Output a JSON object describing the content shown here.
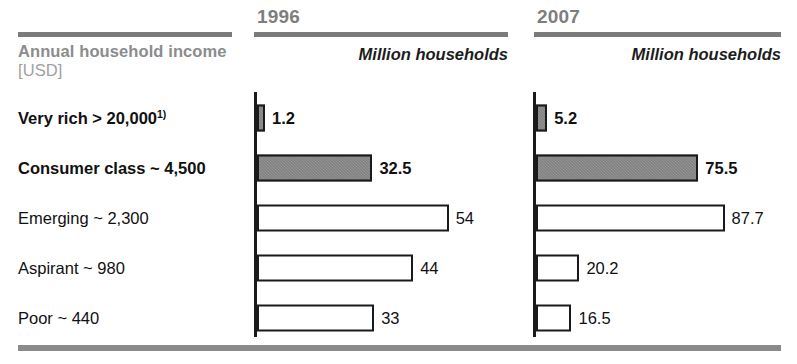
{
  "header": {
    "income_title": "Annual household income",
    "income_unit": "[USD]",
    "year_1996": "1996",
    "year_2007": "2007",
    "unit_1996": "Million households",
    "unit_2007": "Million households"
  },
  "chart_data": {
    "type": "bar",
    "orientation": "horizontal",
    "title": "Annual household income [USD]",
    "xlabel": "Million households",
    "ylabel": "Annual household income [USD]",
    "grid": false,
    "legend": "none",
    "categories": [
      "Very rich > 20,000",
      "Consumer class ~ 4,500",
      "Emerging ~ 2,300",
      "Aspirant ~ 980",
      "Poor ~ 440"
    ],
    "category_notes": [
      "1)",
      "",
      "",
      "",
      ""
    ],
    "category_emphasis": [
      true,
      true,
      false,
      false,
      false
    ],
    "series": [
      {
        "name": "1996",
        "unit": "Million households",
        "values": [
          1.2,
          32.5,
          54,
          44,
          33
        ],
        "labels": [
          "1.2",
          "32.5",
          "54",
          "44",
          "33"
        ],
        "fill": [
          true,
          true,
          false,
          false,
          false
        ],
        "px_per_unit": 3.55,
        "xlim": [
          0,
          72
        ]
      },
      {
        "name": "2007",
        "unit": "Million households",
        "values": [
          5.2,
          75.5,
          87.7,
          20.2,
          16.5
        ],
        "labels": [
          "5.2",
          "75.5",
          "87.7",
          "20.2",
          "16.5"
        ],
        "fill": [
          true,
          true,
          false,
          false,
          false
        ],
        "px_per_unit": 2.15,
        "xlim": [
          0,
          115
        ]
      }
    ]
  },
  "colors": {
    "bar_fill": "#757575",
    "bar_outline": "#1a1a1a",
    "rule": "#7b7b7b",
    "muted_text": "#8c8c8c",
    "body_text": "#111111"
  }
}
